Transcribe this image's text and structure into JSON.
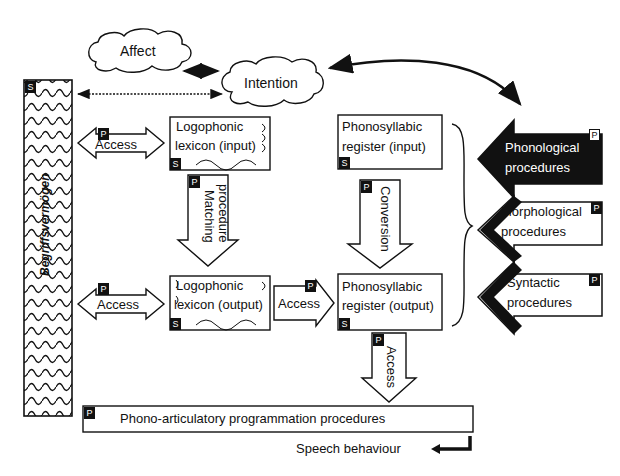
{
  "clouds": {
    "affect": "Affect",
    "intention": "Intention"
  },
  "begriffsvermoegen": {
    "label": "Begriffsvermögen",
    "badge": "S"
  },
  "lexicon_input": {
    "line1": "Logophonic",
    "line2": "lexicon (input)",
    "badge": "S"
  },
  "lexicon_output": {
    "line1": "Logophonic",
    "line2": "lexicon (output)",
    "badge": "S"
  },
  "register_input": {
    "line1": "Phonosyllabic",
    "line2": "register (input)",
    "badge": "S"
  },
  "register_output": {
    "line1": "Phonosyllabic",
    "line2": "register (output)",
    "badge": "S"
  },
  "arrows": {
    "access_top": {
      "label": "Access",
      "badge": "P"
    },
    "access_mid": {
      "label": "Access",
      "badge": "P"
    },
    "access_lex_reg": {
      "label": "Access",
      "badge": "P"
    },
    "access_down": {
      "label": "Access",
      "badge": "P"
    },
    "matching": {
      "line1": "Matching",
      "line2": "procedure",
      "badge": "P"
    },
    "conversion": {
      "label": "Conversion",
      "badge": "P"
    }
  },
  "procedures": [
    {
      "line1": "Phonological",
      "line2": "procedures",
      "badge": "P"
    },
    {
      "line1": "Morphological",
      "line2": "procedures",
      "badge": "P"
    },
    {
      "line1": "Syntactic",
      "line2": "procedures",
      "badge": "P"
    }
  ],
  "programming": {
    "label": "Phono-articulatory programmation procedures",
    "badge": "P"
  },
  "output": {
    "label": "Speech behaviour"
  }
}
